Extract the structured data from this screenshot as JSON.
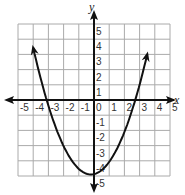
{
  "chart_data": {
    "type": "line",
    "title": "",
    "xlabel": "x",
    "ylabel": "y",
    "xlim": [
      -5,
      5
    ],
    "ylim": [
      -5,
      5
    ],
    "grid": true,
    "x_ticks": [
      "-5",
      "-4",
      "-3",
      "-2",
      "-1",
      "0",
      "1",
      "2",
      "3",
      "4",
      "5"
    ],
    "y_ticks": [
      "5",
      "4",
      "3",
      "2",
      "1",
      "-1",
      "-2",
      "-3",
      "-4",
      "-5"
    ],
    "series": [
      {
        "name": "parabola",
        "equation_approx": "y = 0.47(x + 0.2)^2 - 4.9",
        "vertex": [
          -0.2,
          -4.9
        ],
        "x_intercepts": [
          -3.3,
          2.9
        ],
        "endpoints_arrows": [
          [
            -4.0,
            3.0
          ],
          [
            3.5,
            3.0
          ]
        ]
      }
    ]
  },
  "labels": {
    "x_axis": "x",
    "y_axis": "y"
  }
}
